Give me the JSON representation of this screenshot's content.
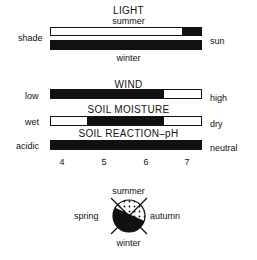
{
  "light": {
    "title": "LIGHT",
    "top_label": "summer",
    "bottom_label": "winter",
    "left_label": "shade",
    "right_label": "sun",
    "summer_fill": [
      0.875,
      1.0
    ],
    "winter_fill": [
      0.0,
      1.0
    ]
  },
  "wind": {
    "title": "WIND",
    "left_label": "low",
    "right_label": "high",
    "fill": [
      0.0,
      0.75
    ]
  },
  "soil_moisture": {
    "title": "SOIL MOISTURE",
    "left_label": "wet",
    "right_label": "dry",
    "fill": [
      0.24,
      0.75
    ]
  },
  "soil_reaction": {
    "title": "SOIL REACTION–pH",
    "left_label": "acidic",
    "right_label": "neutral",
    "fill": [
      0.0,
      1.0
    ],
    "ticks": [
      "4",
      "5",
      "6",
      "7"
    ]
  },
  "seasons": {
    "top": "summer",
    "left": "spring",
    "right": "autumn",
    "bottom": "winter"
  },
  "colors": {
    "ink": "#111111",
    "paper": "#ffffff"
  }
}
